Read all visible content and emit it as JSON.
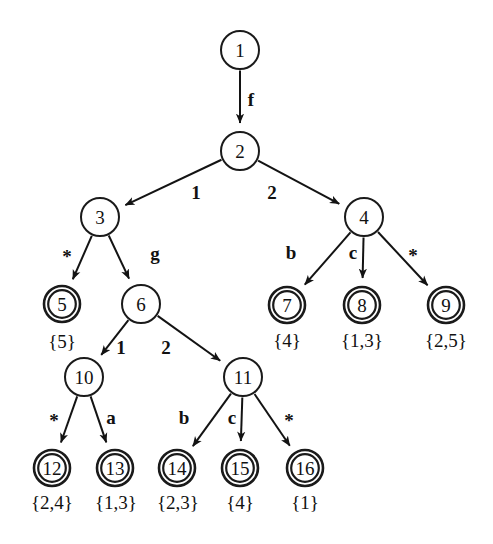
{
  "figure": {
    "kind": "rooted-tree-diagram",
    "background_color": "#ffffff",
    "stroke_color": "#131313",
    "width": 493,
    "height": 544
  },
  "nodes": [
    {
      "id": "n1",
      "label": "1",
      "x": 240,
      "y": 50,
      "r": 19,
      "double": false
    },
    {
      "id": "n2",
      "label": "2",
      "x": 240,
      "y": 151,
      "r": 19,
      "double": false
    },
    {
      "id": "n3",
      "label": "3",
      "x": 100,
      "y": 217,
      "r": 19,
      "double": false
    },
    {
      "id": "n4",
      "label": "4",
      "x": 364,
      "y": 217,
      "r": 19,
      "double": false
    },
    {
      "id": "n5",
      "label": "5",
      "x": 62,
      "y": 304,
      "r": 18,
      "double": true
    },
    {
      "id": "n6",
      "label": "6",
      "x": 141,
      "y": 304,
      "r": 19,
      "double": false
    },
    {
      "id": "n7",
      "label": "7",
      "x": 287,
      "y": 305,
      "r": 18,
      "double": true
    },
    {
      "id": "n8",
      "label": "8",
      "x": 362,
      "y": 305,
      "r": 18,
      "double": true
    },
    {
      "id": "n9",
      "label": "9",
      "x": 446,
      "y": 305,
      "r": 18,
      "double": true
    },
    {
      "id": "n10",
      "label": "10",
      "x": 84,
      "y": 377,
      "r": 19,
      "double": false
    },
    {
      "id": "n11",
      "label": "11",
      "x": 243,
      "y": 377,
      "r": 19,
      "double": false
    },
    {
      "id": "n12",
      "label": "12",
      "x": 52,
      "y": 468,
      "r": 18,
      "double": true
    },
    {
      "id": "n13",
      "label": "13",
      "x": 115,
      "y": 468,
      "r": 18,
      "double": true
    },
    {
      "id": "n14",
      "label": "14",
      "x": 177,
      "y": 468,
      "r": 18,
      "double": true
    },
    {
      "id": "n15",
      "label": "15",
      "x": 240,
      "y": 468,
      "r": 18,
      "double": true
    },
    {
      "id": "n16",
      "label": "16",
      "x": 305,
      "y": 468,
      "r": 18,
      "double": true
    }
  ],
  "edges": [
    {
      "id": "e1",
      "from": "n1",
      "to": "n2",
      "label": "f",
      "lx": 251,
      "ly": 99
    },
    {
      "id": "e2",
      "from": "n2",
      "to": "n3",
      "label": "1",
      "lx": 196,
      "ly": 192
    },
    {
      "id": "e3",
      "from": "n2",
      "to": "n4",
      "label": "2",
      "lx": 272,
      "ly": 192
    },
    {
      "id": "e4",
      "from": "n3",
      "to": "n5",
      "label": "*",
      "lx": 67,
      "ly": 256
    },
    {
      "id": "e5",
      "from": "n3",
      "to": "n6",
      "label": "g",
      "lx": 155,
      "ly": 253
    },
    {
      "id": "e6",
      "from": "n4",
      "to": "n7",
      "label": "b",
      "lx": 291,
      "ly": 252
    },
    {
      "id": "e7",
      "from": "n4",
      "to": "n8",
      "label": "c",
      "lx": 353,
      "ly": 252
    },
    {
      "id": "e8",
      "from": "n4",
      "to": "n9",
      "label": "*",
      "lx": 413,
      "ly": 255
    },
    {
      "id": "e9",
      "from": "n6",
      "to": "n10",
      "label": "1",
      "lx": 121,
      "ly": 347
    },
    {
      "id": "e10",
      "from": "n6",
      "to": "n11",
      "label": "2",
      "lx": 166,
      "ly": 347
    },
    {
      "id": "e11",
      "from": "n10",
      "to": "n12",
      "label": "*",
      "lx": 54,
      "ly": 420
    },
    {
      "id": "e12",
      "from": "n10",
      "to": "n13",
      "label": "a",
      "lx": 111,
      "ly": 417
    },
    {
      "id": "e13",
      "from": "n11",
      "to": "n14",
      "label": "b",
      "lx": 184,
      "ly": 417
    },
    {
      "id": "e14",
      "from": "n11",
      "to": "n15",
      "label": "c",
      "lx": 232,
      "ly": 417
    },
    {
      "id": "e15",
      "from": "n11",
      "to": "n16",
      "label": "*",
      "lx": 289,
      "ly": 420
    }
  ],
  "set_labels": [
    {
      "id": "s5",
      "node": "n5",
      "text": "{5}",
      "x": 62,
      "y": 341
    },
    {
      "id": "s7",
      "node": "n7",
      "text": "{4}",
      "x": 287,
      "y": 340
    },
    {
      "id": "s8",
      "node": "n8",
      "text": "{1,3}",
      "x": 362,
      "y": 340
    },
    {
      "id": "s9",
      "node": "n9",
      "text": "{2,5}",
      "x": 446,
      "y": 340
    },
    {
      "id": "s12",
      "node": "n12",
      "text": "{2,4}",
      "x": 52,
      "y": 502
    },
    {
      "id": "s13",
      "node": "n13",
      "text": "{1,3}",
      "x": 116,
      "y": 502
    },
    {
      "id": "s14",
      "node": "n14",
      "text": "{2,3}",
      "x": 178,
      "y": 502
    },
    {
      "id": "s15",
      "node": "n15",
      "text": "{4}",
      "x": 240,
      "y": 502
    },
    {
      "id": "s16",
      "node": "n16",
      "text": "{1}",
      "x": 305,
      "y": 502
    }
  ]
}
